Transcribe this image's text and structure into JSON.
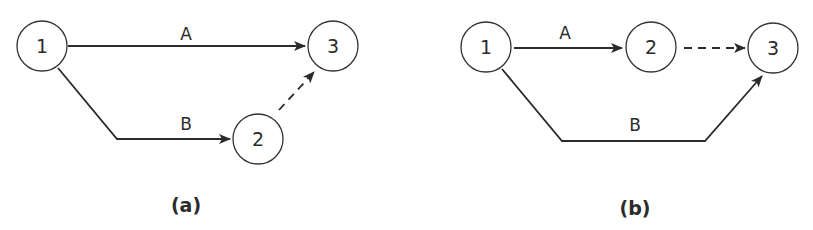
{
  "diagrams": [
    {
      "caption": "(a)",
      "nodes": [
        {
          "id": "1",
          "label": "1"
        },
        {
          "id": "2",
          "label": "2"
        },
        {
          "id": "3",
          "label": "3"
        }
      ],
      "edges": [
        {
          "from": "1",
          "to": "3",
          "label": "A",
          "style": "solid"
        },
        {
          "from": "1",
          "to": "2",
          "label": "B",
          "style": "solid"
        },
        {
          "from": "2",
          "to": "3",
          "label": "",
          "style": "dashed"
        }
      ]
    },
    {
      "caption": "(b)",
      "nodes": [
        {
          "id": "1",
          "label": "1"
        },
        {
          "id": "2",
          "label": "2"
        },
        {
          "id": "3",
          "label": "3"
        }
      ],
      "edges": [
        {
          "from": "1",
          "to": "2",
          "label": "A",
          "style": "solid"
        },
        {
          "from": "2",
          "to": "3",
          "label": "",
          "style": "dashed"
        },
        {
          "from": "1",
          "to": "3",
          "label": "B",
          "style": "solid"
        }
      ]
    }
  ],
  "colors": {
    "stroke": "#2b2b2b",
    "background": "#ffffff"
  }
}
